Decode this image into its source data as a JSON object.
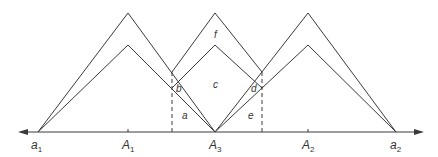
{
  "diagram": {
    "axis_labels": [
      {
        "id": "a1",
        "main": "a",
        "sub": "1"
      },
      {
        "id": "A1",
        "main": "A",
        "sub": "1"
      },
      {
        "id": "A3",
        "main": "A",
        "sub": "3"
      },
      {
        "id": "A2",
        "main": "A",
        "sub": "2"
      },
      {
        "id": "a2",
        "main": "a",
        "sub": "2"
      }
    ],
    "region_labels": {
      "a": "a",
      "b": "b",
      "c": "c",
      "d": "d",
      "e": "e",
      "f": "f"
    },
    "colors": {
      "line": "#3a3a3a",
      "text": "#333333",
      "background": "#ffffff"
    }
  }
}
